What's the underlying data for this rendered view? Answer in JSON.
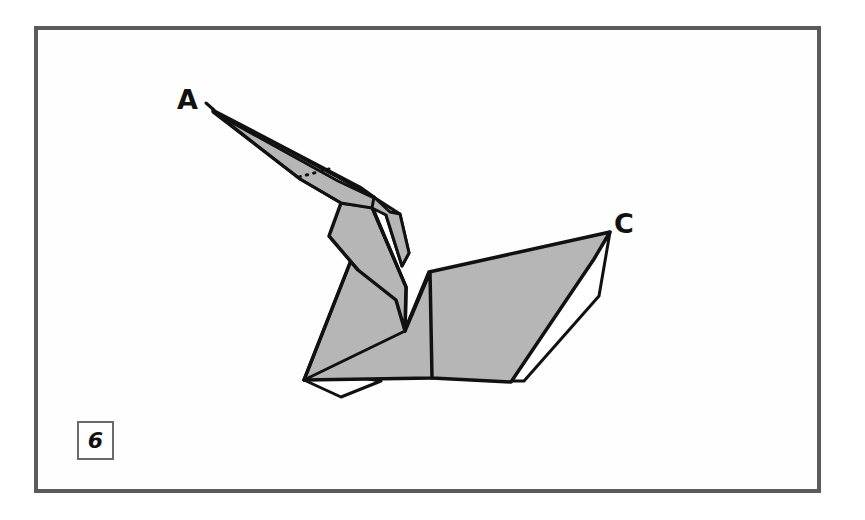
{
  "figure": {
    "kind": "origami-step-diagram",
    "step_number": "6",
    "background_color": "#ffffff",
    "paper_fill_color": "#b6b6b6",
    "paper_back_color": "#ffffff",
    "outline_color": "#111111",
    "frame_color": "#5b5b5b",
    "badge_border_color": "#6a6a6a"
  },
  "frame": {
    "name": "instruction-panel-frame",
    "x": 34,
    "y": 26,
    "width": 787,
    "height": 467,
    "border_width": 4
  },
  "badge": {
    "name": "step-number-badge",
    "label": "6",
    "x": 77,
    "y": 421,
    "width": 37,
    "height": 39
  },
  "labels": [
    {
      "id": "A",
      "text": "A",
      "x": 177,
      "y": 86,
      "anchor_point": {
        "x": 213,
        "y": 110
      }
    },
    {
      "id": "C",
      "text": "C",
      "x": 614,
      "y": 210,
      "anchor_point": {
        "x": 610,
        "y": 232
      }
    }
  ],
  "shapes": {
    "beak_upper": {
      "name": "beak-upper-facet",
      "fill": "#b6b6b6",
      "points": "213,110 357,186 372,196 338,176"
    },
    "beak_lower": {
      "name": "beak-lower-facet",
      "fill": "#b6b6b6",
      "points": "213,110 334,180 369,200 387,212 360,203"
    },
    "neck_front": {
      "name": "neck-front-facet",
      "fill": "#b6b6b6",
      "points": "213,112 360,204 392,216 398,246 374,214 300,178"
    },
    "head_wedge": {
      "name": "head-wedge-facet",
      "fill": "#b6b6b6",
      "points": "357,186 399,213 409,252 401,264 386,214 372,196"
    },
    "neck_body": {
      "name": "neck-body-facet",
      "fill": "#b6b6b6",
      "points": "370,205 400,258 406,284 396,300 358,284 328,252 340,206"
    },
    "body_main": {
      "name": "body-main-facet",
      "fill": "#b6b6b6",
      "points": "374,212 406,288 404,330 428,272 432,378 304,380"
    },
    "wing_right": {
      "name": "wing-right-facet",
      "fill": "#b6b6b6",
      "points": "610,232 428,273 404,331 432,378 510,382 592,258"
    },
    "tail_flap": {
      "name": "tail-flap-facet",
      "fill": "#ffffff",
      "points": "610,232 597,300 523,380 509,381 594,262"
    },
    "bottom_flap": {
      "name": "bottom-fold-flap",
      "fill": "#ffffff",
      "points": "304,380 341,396 379,381 349,377"
    }
  },
  "fold_lines": {
    "dotted_crease": {
      "name": "dotted-crease-line",
      "from": {
        "x": 300,
        "y": 176
      },
      "to": {
        "x": 328,
        "y": 169
      },
      "style": "dotted"
    }
  }
}
